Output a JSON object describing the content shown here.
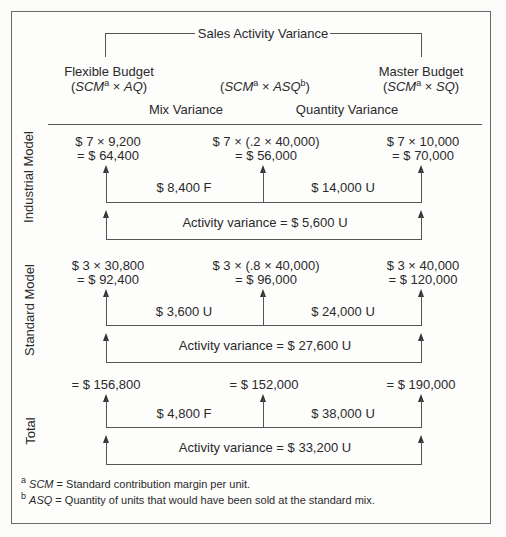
{
  "header": {
    "title": "Sales Activity Variance",
    "columns": [
      {
        "label": "Flexible Budget",
        "formula_pre": "(",
        "formula_a": "SCM",
        "sup_a": "a",
        "times": " × ",
        "formula_b": "AQ",
        "sup_b": "",
        "formula_post": ")"
      },
      {
        "label": "",
        "formula_pre": "(",
        "formula_a": "SCM",
        "sup_a": "a",
        "times": " × ",
        "formula_b": "ASQ",
        "sup_b": "b",
        "formula_post": ")"
      },
      {
        "label": "Master Budget",
        "formula_pre": "(",
        "formula_a": "SCM",
        "sup_a": "a",
        "times": " × ",
        "formula_b": "SQ",
        "sup_b": "",
        "formula_post": ")"
      }
    ],
    "variance_labels": {
      "mix": "Mix Variance",
      "quantity": "Quantity Variance"
    }
  },
  "sections": [
    {
      "name": "Industrial Model",
      "values": [
        {
          "line1": "$ 7 × 9,200",
          "line2": "= $ 64,400"
        },
        {
          "line1": "$ 7 × (.2 × 40,000)",
          "line2": "= $ 56,000"
        },
        {
          "line1": "$ 7 × 10,000",
          "line2": "= $ 70,000"
        }
      ],
      "mix_variance": "$ 8,400 F",
      "quantity_variance": "$ 14,000 U",
      "activity_variance": "Activity variance = $ 5,600 U"
    },
    {
      "name": "Standard Model",
      "values": [
        {
          "line1": "$ 3 × 30,800",
          "line2": "= $ 92,400"
        },
        {
          "line1": "$ 3 × (.8 × 40,000)",
          "line2": "= $ 96,000"
        },
        {
          "line1": "$ 3 × 40,000",
          "line2": "= $ 120,000"
        }
      ],
      "mix_variance": "$ 3,600 U",
      "quantity_variance": "$ 24,000 U",
      "activity_variance": "Activity variance = $ 27,600 U"
    },
    {
      "name": "Total",
      "values": [
        {
          "line1": "",
          "line2": "= $ 156,800"
        },
        {
          "line1": "",
          "line2": "= $ 152,000"
        },
        {
          "line1": "",
          "line2": "= $ 190,000"
        }
      ],
      "mix_variance": "$ 4,800 F",
      "quantity_variance": "$ 38,000 U",
      "activity_variance": "Activity variance = $ 33,200 U"
    }
  ],
  "footnotes": [
    {
      "mark": "a",
      "term": "SCM",
      "text": " = Standard contribution margin per unit."
    },
    {
      "mark": "b",
      "term": "ASQ",
      "text": " = Quantity of units that would have been sold at the standard mix."
    }
  ],
  "colors": {
    "line": "#555555",
    "text": "#2a2a2a",
    "border": "#6b6b6b"
  }
}
